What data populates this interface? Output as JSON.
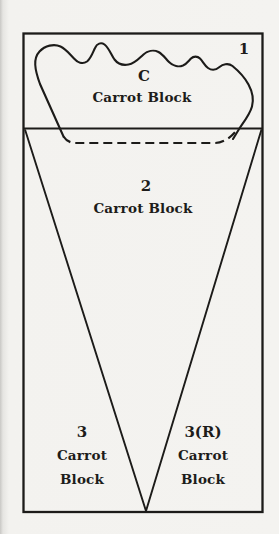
{
  "figure": {
    "background_color": "#f3f2ef",
    "line_color": "#1c1b19",
    "corner_label": "1",
    "regions": {
      "capping": {
        "number": "C",
        "name": "Carrot Block"
      },
      "main": {
        "number": "2",
        "name": "Carrot Block"
      },
      "left": {
        "number": "3",
        "name": "Carrot Block"
      },
      "right": {
        "number": "3(R)",
        "name": "Carrot Block"
      }
    }
  }
}
